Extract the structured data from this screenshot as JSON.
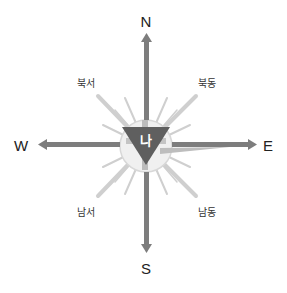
{
  "diagram": {
    "type": "compass-rose",
    "center_label": "나",
    "cardinals": {
      "north": "N",
      "south": "S",
      "east": "E",
      "west": "W"
    },
    "intercardinals": {
      "northwest": "북서",
      "northeast": "북동",
      "southwest": "남서",
      "southeast": "남동"
    },
    "colors": {
      "arrow": "#7a7a7a",
      "center_triangle": "#5f5f5f",
      "rays": "#c8c8c8",
      "ring": "#e0e0e0",
      "text": "#222222"
    }
  }
}
